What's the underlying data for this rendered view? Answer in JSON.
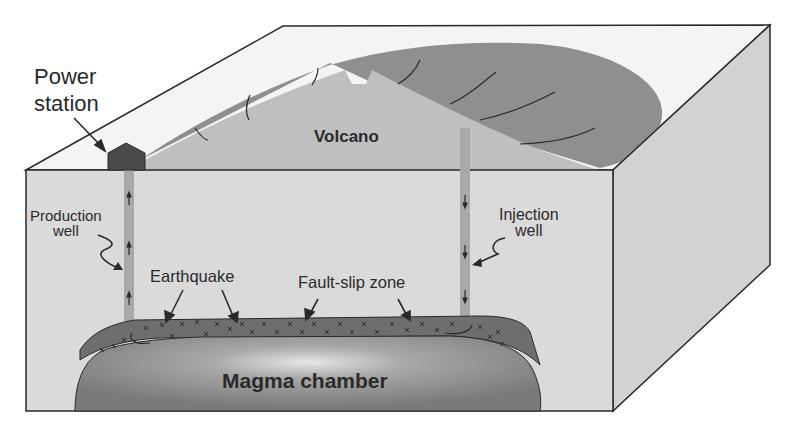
{
  "diagram": {
    "type": "block-diagram",
    "labels": {
      "power_station_line1": "Power",
      "power_station_line2": "station",
      "volcano": "Volcano",
      "production_well_line1": "Production",
      "production_well_line2": "well",
      "injection_well_line1": "Injection",
      "injection_well_line2": "well",
      "earthquake": "Earthquake",
      "fault_slip_zone": "Fault-slip zone",
      "magma_chamber": "Magma chamber"
    },
    "flow_directions": {
      "production_well": "up",
      "injection_well": "down"
    },
    "colors": {
      "background": "#ffffff",
      "block_front": "#d9d9d9",
      "block_top": "#f4f4f4",
      "block_side": "#cfcfcf",
      "volcano": "#bfbfbf",
      "plume": "#8f8f8f",
      "well": "#a8a8a8",
      "power_station": "#4a4a4a",
      "fault_zone": "#6e6e6e",
      "magma_chamber": "#808080",
      "outline": "#2a2a2a"
    }
  }
}
